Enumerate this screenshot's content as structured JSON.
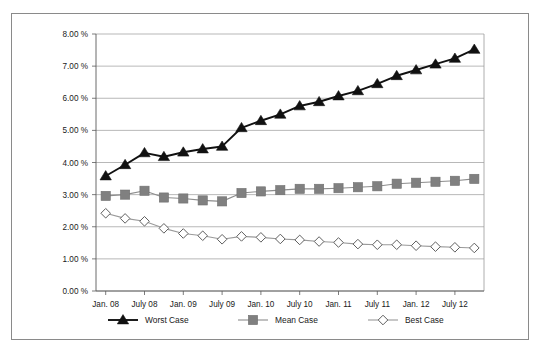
{
  "chart_data": {
    "type": "line",
    "title": "",
    "xlabel": "",
    "ylabel": "",
    "ylim": [
      0,
      8
    ],
    "ytick_values": [
      0,
      1,
      2,
      3,
      4,
      5,
      6,
      7,
      8
    ],
    "ytick_labels": [
      "0.00 %",
      "1.00 %",
      "2.00 %",
      "3.00 %",
      "4.00 %",
      "5.00 %",
      "6.00 %",
      "7.00 %",
      "8.00 %"
    ],
    "grid": true,
    "legend_position": "bottom",
    "x_tick_labels": [
      "Jan. 08",
      "July 08",
      "Jan. 09",
      "July 09",
      "Jan. 10",
      "July 10",
      "Jan. 11",
      "July 11",
      "Jan. 12",
      "July 12"
    ],
    "x_tick_indices": [
      0,
      2,
      4,
      6,
      8,
      10,
      12,
      14,
      16,
      18
    ],
    "x": [
      "Jan. 08",
      "Apr. 08",
      "July 08",
      "Oct. 08",
      "Jan. 09",
      "Apr. 09",
      "July 09",
      "Oct. 09",
      "Jan. 10",
      "Apr. 10",
      "July 10",
      "Oct. 10",
      "Jan. 11",
      "Apr. 11",
      "July 11",
      "Oct. 11",
      "Jan. 12",
      "Apr. 12",
      "July 12",
      "Oct. 12"
    ],
    "series": [
      {
        "name": "Worst Case",
        "marker": "triangle",
        "color": "#111111",
        "line_color": "#111111",
        "values": [
          3.58,
          3.93,
          4.3,
          4.18,
          4.32,
          4.42,
          4.5,
          5.08,
          5.3,
          5.5,
          5.76,
          5.89,
          6.07,
          6.23,
          6.45,
          6.7,
          6.88,
          7.06,
          7.24,
          7.52
        ]
      },
      {
        "name": "Mean Case",
        "marker": "square",
        "color": "#808080",
        "line_color": "#8d8d8d",
        "values": [
          2.96,
          3.0,
          3.12,
          2.91,
          2.88,
          2.82,
          2.79,
          3.05,
          3.1,
          3.14,
          3.18,
          3.18,
          3.2,
          3.23,
          3.26,
          3.34,
          3.37,
          3.4,
          3.43,
          3.49
        ]
      },
      {
        "name": "Best Case",
        "marker": "diamond",
        "color": "#ffffff",
        "line_color": "#9a9a9a",
        "values": [
          2.42,
          2.26,
          2.17,
          1.95,
          1.79,
          1.72,
          1.61,
          1.7,
          1.67,
          1.62,
          1.59,
          1.54,
          1.51,
          1.46,
          1.44,
          1.44,
          1.41,
          1.38,
          1.36,
          1.34
        ]
      }
    ]
  },
  "legend": {
    "items": [
      {
        "label": "Worst Case"
      },
      {
        "label": "Mean Case"
      },
      {
        "label": "Best Case"
      }
    ]
  },
  "colors": {
    "worst_case": "#111111",
    "mean_case": "#808080",
    "best_case_fill": "#ffffff",
    "best_case_stroke": "#9a9a9a",
    "gridline": "#9a9a9a",
    "axis": "#5a5a5a",
    "frame_border": "#8a8a8a",
    "background": "#ffffff",
    "text": "#1a1a1a"
  }
}
